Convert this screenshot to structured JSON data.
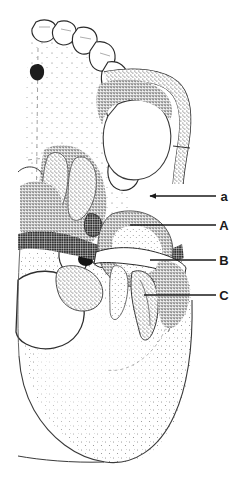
{
  "figure": {
    "kind": "anatomical-line-drawing",
    "background_color": "#ffffff",
    "ink_color": "#1a1a1a",
    "stipple_color": "#2b2b2b",
    "width": 245,
    "height": 484
  },
  "labels": [
    {
      "id": "label-a",
      "text": "a",
      "case": "lowercase",
      "x": 224,
      "y": 200,
      "leader": {
        "x1": 150,
        "y1": 196,
        "x2": 216,
        "y2": 196,
        "arrow": true
      }
    },
    {
      "id": "label-A",
      "text": "A",
      "case": "uppercase",
      "x": 224,
      "y": 230,
      "leader": {
        "x1": 130,
        "y1": 225,
        "x2": 216,
        "y2": 225,
        "arrow": false
      }
    },
    {
      "id": "label-B",
      "text": "B",
      "case": "uppercase",
      "x": 224,
      "y": 265,
      "leader": {
        "x1": 150,
        "y1": 260,
        "x2": 216,
        "y2": 260,
        "arrow": false
      }
    },
    {
      "id": "label-C",
      "text": "C",
      "case": "uppercase",
      "x": 224,
      "y": 300,
      "leader": {
        "x1": 144,
        "y1": 295,
        "x2": 216,
        "y2": 295,
        "arrow": false
      }
    }
  ],
  "teeth": {
    "count": 8,
    "arch_side": "left",
    "description": "upper dental arch, incisor through third molar"
  },
  "regions": [
    {
      "name": "hard-palate",
      "description": "midline palate with stippled suture marks"
    },
    {
      "name": "zygomatic-arch",
      "description": "lateral arch bounding right side"
    },
    {
      "name": "infratemporal-fossa",
      "description": "large light oval enclosed by arch"
    },
    {
      "name": "mandibular-fossa",
      "description": "rounded stippled eminence below fossa"
    },
    {
      "name": "foramen-magnum",
      "description": "large white oval at lower left"
    },
    {
      "name": "occipital-base",
      "description": "broad stippled convex plate at bottom"
    },
    {
      "name": "styloid-process",
      "description": "slender spur descending at lower centre"
    }
  ]
}
